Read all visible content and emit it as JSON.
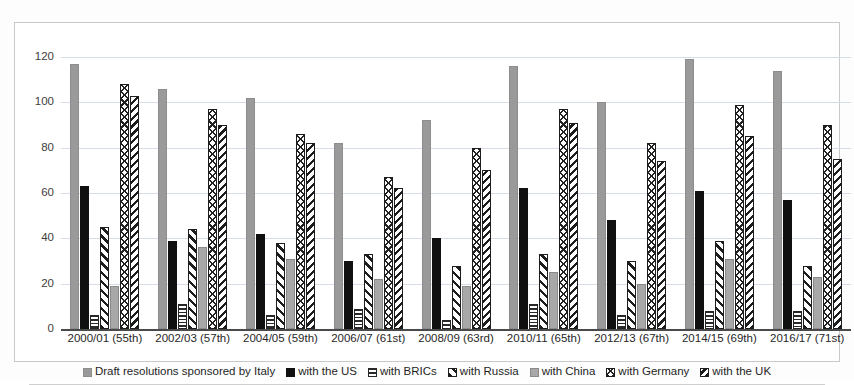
{
  "chart_data": {
    "type": "bar",
    "title": "",
    "subtitle": "",
    "xlabel": "",
    "ylabel": "",
    "ylim": [
      0,
      120
    ],
    "yticks": [
      0,
      20,
      40,
      60,
      80,
      100,
      120
    ],
    "grid": true,
    "legend_position": "bottom",
    "orientation": "vertical-grouped",
    "categories": [
      "2000/01 (55th)",
      "2002/03 (57th)",
      "2004/05 (59th)",
      "2006/07 (61st)",
      "2008/09 (63rd)",
      "2010/11 (65th)",
      "2012/13 (67th)",
      "2014/15 (69th)",
      "2016/17 (71st)"
    ],
    "series": [
      {
        "name": "Draft resolutions sponsored by Italy",
        "pattern": "solid-grey",
        "color": "#9a9a9a",
        "values": [
          117,
          106,
          102,
          82,
          92,
          116,
          100,
          119,
          114
        ]
      },
      {
        "name": "with the US",
        "pattern": "solid-black",
        "color": "#101010",
        "values": [
          63,
          39,
          42,
          30,
          40,
          62,
          48,
          61,
          57
        ]
      },
      {
        "name": "with BRICs",
        "pattern": "horizontal-lines",
        "color": "#2a2a2a",
        "values": [
          6,
          11,
          6,
          9,
          4,
          11,
          6,
          8,
          8
        ]
      },
      {
        "name": "with Russia",
        "pattern": "wide-diagonal",
        "color": "#1d1d1d",
        "values": [
          45,
          44,
          38,
          33,
          28,
          33,
          30,
          39,
          28
        ]
      },
      {
        "name": "with China",
        "pattern": "solid-light-grey",
        "color": "#a8a8a8",
        "values": [
          19,
          36,
          31,
          22,
          19,
          25,
          20,
          31,
          23
        ]
      },
      {
        "name": "with Germany",
        "pattern": "cross-hatch",
        "color": "#222222",
        "values": [
          108,
          97,
          86,
          67,
          80,
          97,
          82,
          99,
          90
        ]
      },
      {
        "name": "with the UK",
        "pattern": "narrow-diagonal",
        "color": "#1d1d1d",
        "values": [
          103,
          90,
          82,
          62,
          70,
          91,
          74,
          85,
          75
        ]
      }
    ]
  },
  "legend": {
    "items": [
      "Draft resolutions sponsored by Italy",
      "with the US",
      "with BRICs",
      "with Russia",
      "with China",
      "with Germany",
      "with the UK"
    ]
  }
}
